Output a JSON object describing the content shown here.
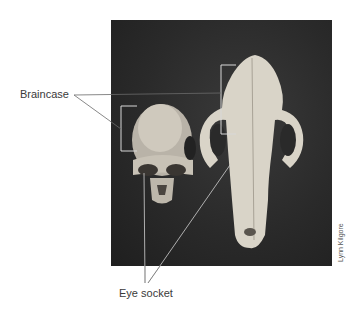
{
  "figure": {
    "labels": {
      "braincase": "Braincase",
      "eye_socket": "Eye socket"
    },
    "credit": "Lynn Kilgore",
    "photo": {
      "subject_left": "primate-skull",
      "subject_right": "carnivore-skull",
      "background_color": "#2a2a2a"
    },
    "colors": {
      "leader_line": "#6a6a6a",
      "bracket": "#d8d8d8",
      "bone": "#d9d4c8"
    }
  }
}
